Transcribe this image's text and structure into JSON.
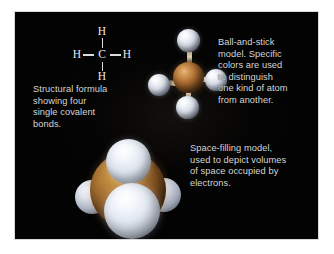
{
  "figure": {
    "background_color": "#ffffff",
    "plate_color": "#030303",
    "text_color": "#d6d6d6"
  },
  "structural_formula": {
    "caption": "Structural formula\nshowing four\nsingle covalent\nbonds.",
    "atoms": {
      "top": "H",
      "left": "H",
      "center": "C",
      "right": "H",
      "bottom": "H"
    },
    "bond_count": 4,
    "bond_type": "single covalent"
  },
  "ball_and_stick": {
    "caption": "Ball-and-stick\nmodel. Specific\ncolors are used\nto distinguish\none kind of atom\nfrom another.",
    "carbon_color": "#b8793a",
    "hydrogen_color": "#d5dae4",
    "bond_color": "#ddcfb6",
    "hydrogen_count": 4
  },
  "space_filling": {
    "caption": "Space-filling model,\nused to depict volumes\nof space occupied by\nelectrons.",
    "carbon_color": "#a87231",
    "hydrogen_color": "#e2e8f1",
    "hydrogen_count": 4
  }
}
